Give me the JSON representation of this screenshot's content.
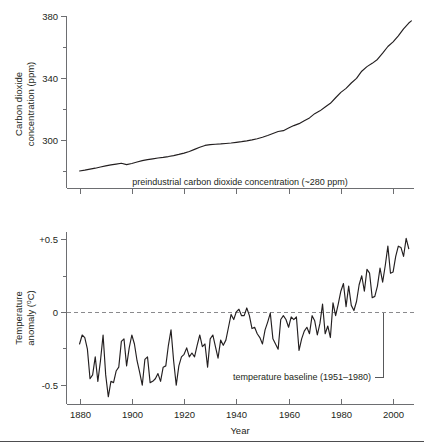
{
  "figure": {
    "name": "co2-and-temperature-anomaly-figure",
    "panels": [
      "carbon-dioxide-concentration",
      "temperature-anomaly"
    ]
  },
  "chart_data": [
    {
      "type": "line",
      "id": "co2",
      "title": "",
      "xlabel": "",
      "ylabel": "Carbon dioxide concentration (ppm)",
      "ylabel_line1": "Carbon dioxide",
      "ylabel_line2": "concentration (ppm)",
      "xlim": [
        1875,
        2008
      ],
      "ylim": [
        280,
        385
      ],
      "yticks": [
        300,
        340,
        380
      ],
      "ytick_labels": [
        "300",
        "340",
        "380"
      ],
      "yticks_minor": [
        320,
        360
      ],
      "xticks": [
        1880,
        1900,
        1920,
        1940,
        1960,
        1980,
        2000
      ],
      "grid": false,
      "legend": "none",
      "annotations": [
        {
          "name": "preindustrial-annotation",
          "text": "preindustrial carbon dioxide concentration (~280 ppm)",
          "value_ppm": 280
        }
      ],
      "x": [
        1880,
        1882,
        1884,
        1886,
        1888,
        1890,
        1892,
        1894,
        1896,
        1898,
        1900,
        1902,
        1904,
        1906,
        1908,
        1910,
        1912,
        1914,
        1916,
        1918,
        1920,
        1922,
        1924,
        1926,
        1928,
        1930,
        1932,
        1934,
        1936,
        1938,
        1940,
        1942,
        1944,
        1946,
        1948,
        1950,
        1952,
        1954,
        1956,
        1958,
        1960,
        1962,
        1964,
        1966,
        1968,
        1970,
        1972,
        1974,
        1976,
        1978,
        1980,
        1982,
        1984,
        1986,
        1988,
        1990,
        1992,
        1994,
        1996,
        1998,
        2000,
        2002,
        2004,
        2006,
        2007
      ],
      "values": [
        290.7,
        291.2,
        291.8,
        292.4,
        293.1,
        293.8,
        294.4,
        294.9,
        295.4,
        294.6,
        295.3,
        296.2,
        297.0,
        297.6,
        298.1,
        298.6,
        299.0,
        299.5,
        300.1,
        300.8,
        301.6,
        302.6,
        303.9,
        305.2,
        306.3,
        306.8,
        307.0,
        307.2,
        307.5,
        307.8,
        308.2,
        308.6,
        309.1,
        309.7,
        310.4,
        311.3,
        312.4,
        313.6,
        314.8,
        315.3,
        316.9,
        318.4,
        319.6,
        321.4,
        323.1,
        325.7,
        327.4,
        329.7,
        332.0,
        335.4,
        338.7,
        341.1,
        344.4,
        347.2,
        351.6,
        354.4,
        356.4,
        358.8,
        362.6,
        366.7,
        369.5,
        373.2,
        377.5,
        381.0,
        382.3
      ]
    },
    {
      "type": "line",
      "id": "temperature-anomaly",
      "title": "",
      "xlabel": "Year",
      "ylabel": "Temperature anomaly (oC)",
      "ylabel_line1": "Temperature",
      "ylabel_line2": "anomaly (oC)",
      "ylabel_unit_prefix": "anomaly (",
      "ylabel_unit_degree": "o",
      "ylabel_unit_suffix": "C)",
      "xlim": [
        1875,
        2008
      ],
      "ylim": [
        -0.62,
        0.72
      ],
      "yticks": [
        -0.5,
        0,
        0.5
      ],
      "ytick_labels": [
        "-0.5",
        "0",
        "+0.5"
      ],
      "yticks_minor": [
        -0.25,
        0.25
      ],
      "xticks": [
        1880,
        1900,
        1920,
        1940,
        1960,
        1980,
        2000
      ],
      "xtick_labels": [
        "1880",
        "1900",
        "1920",
        "1940",
        "1960",
        "1980",
        "2000"
      ],
      "grid": false,
      "legend": "none",
      "baseline_value": 0,
      "annotations": [
        {
          "name": "baseline-annotation",
          "text": "temperature baseline (1951–1980)",
          "period_start": 1951,
          "period_end": 1980
        }
      ],
      "x": [
        1880,
        1881,
        1882,
        1883,
        1884,
        1885,
        1886,
        1887,
        1888,
        1889,
        1890,
        1891,
        1892,
        1893,
        1894,
        1895,
        1896,
        1897,
        1898,
        1899,
        1900,
        1901,
        1902,
        1903,
        1904,
        1905,
        1906,
        1907,
        1908,
        1909,
        1910,
        1911,
        1912,
        1913,
        1914,
        1915,
        1916,
        1917,
        1918,
        1919,
        1920,
        1921,
        1922,
        1923,
        1924,
        1925,
        1926,
        1927,
        1928,
        1929,
        1930,
        1931,
        1932,
        1933,
        1934,
        1935,
        1936,
        1937,
        1938,
        1939,
        1940,
        1941,
        1942,
        1943,
        1944,
        1945,
        1946,
        1947,
        1948,
        1949,
        1950,
        1951,
        1952,
        1953,
        1954,
        1955,
        1956,
        1957,
        1958,
        1959,
        1960,
        1961,
        1962,
        1963,
        1964,
        1965,
        1966,
        1967,
        1968,
        1969,
        1970,
        1971,
        1972,
        1973,
        1974,
        1975,
        1976,
        1977,
        1978,
        1979,
        1980,
        1981,
        1982,
        1983,
        1984,
        1985,
        1986,
        1987,
        1988,
        1989,
        1990,
        1991,
        1992,
        1993,
        1994,
        1995,
        1996,
        1997,
        1998,
        1999,
        2000,
        2001,
        2002,
        2003,
        2004,
        2005,
        2006
      ],
      "values": [
        -0.15,
        -0.08,
        -0.1,
        -0.19,
        -0.42,
        -0.39,
        -0.25,
        -0.44,
        -0.28,
        -0.08,
        -0.39,
        -0.56,
        -0.44,
        -0.45,
        -0.36,
        -0.33,
        -0.13,
        -0.11,
        -0.32,
        -0.18,
        -0.08,
        -0.15,
        -0.28,
        -0.37,
        -0.47,
        -0.27,
        -0.25,
        -0.45,
        -0.44,
        -0.42,
        -0.38,
        -0.44,
        -0.33,
        -0.32,
        -0.16,
        -0.04,
        -0.28,
        -0.47,
        -0.32,
        -0.25,
        -0.23,
        -0.18,
        -0.25,
        -0.22,
        -0.25,
        -0.16,
        -0.08,
        -0.17,
        -0.15,
        -0.33,
        -0.11,
        -0.08,
        -0.17,
        -0.26,
        -0.12,
        -0.16,
        -0.12,
        -0.02,
        0.08,
        0.04,
        0.1,
        0.12,
        0.07,
        0.07,
        0.13,
        0.07,
        -0.03,
        -0.02,
        -0.07,
        -0.1,
        -0.15,
        -0.04,
        0.02,
        0.09,
        -0.11,
        -0.15,
        -0.19,
        0.04,
        0.07,
        0.04,
        -0.02,
        0.06,
        0.04,
        0.06,
        -0.2,
        -0.11,
        -0.05,
        -0.02,
        -0.07,
        0.07,
        0.03,
        -0.08,
        0.01,
        0.16,
        -0.07,
        -0.01,
        -0.1,
        0.17,
        0.07,
        0.16,
        0.26,
        0.32,
        0.14,
        0.3,
        0.15,
        0.11,
        0.18,
        0.31,
        0.38,
        0.26,
        0.43,
        0.4,
        0.21,
        0.22,
        0.3,
        0.44,
        0.33,
        0.46,
        0.61,
        0.4,
        0.41,
        0.53,
        0.61,
        0.6,
        0.53,
        0.67,
        0.59
      ]
    }
  ]
}
